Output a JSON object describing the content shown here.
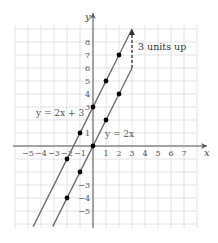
{
  "chart_data": {
    "type": "line",
    "title": "",
    "xlabel": "x",
    "ylabel": "y",
    "xlim": [
      -6,
      7.5
    ],
    "ylim": [
      -6,
      9
    ],
    "grid": true,
    "x_ticks": [
      -5,
      -4,
      -3,
      -2,
      -1,
      1,
      2,
      3,
      4,
      5,
      6,
      7
    ],
    "y_ticks": [
      -5,
      -4,
      -3,
      1,
      3,
      4,
      5,
      6,
      7,
      8
    ],
    "series": [
      {
        "name": "y = 2x + 3",
        "slope": 2,
        "intercept": 3,
        "points": [
          [
            -2,
            -1
          ],
          [
            -1,
            1
          ],
          [
            0,
            3
          ],
          [
            1,
            5
          ],
          [
            2,
            7
          ]
        ]
      },
      {
        "name": "y = 2x",
        "slope": 2,
        "intercept": 0,
        "points": [
          [
            -2,
            -4
          ],
          [
            -1,
            -2
          ],
          [
            0,
            0
          ],
          [
            1,
            2
          ],
          [
            2,
            4
          ]
        ]
      }
    ],
    "annotations": [
      {
        "text": "3 units up",
        "type": "dashed-arrow",
        "x": 3,
        "from_y": 6,
        "to_y": 9
      }
    ]
  },
  "labels": {
    "x_axis": "x",
    "y_axis": "y",
    "line1": "y = 2x + 3",
    "line2": "y = 2x",
    "shift": "3 units up"
  },
  "colors": {
    "grid": "#dddddd",
    "axis": "#555555",
    "line": "#666666",
    "point": "#000000"
  }
}
